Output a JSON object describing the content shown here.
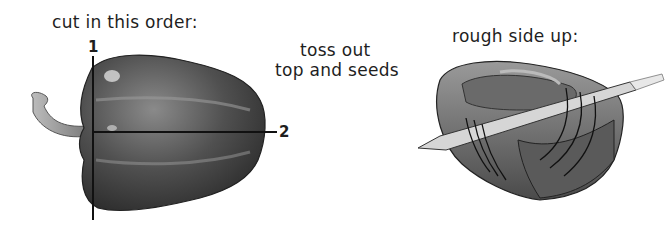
{
  "step1": {
    "caption": "cut in this order:",
    "cut_labels": [
      "1",
      "2"
    ]
  },
  "step2": {
    "caption_line1": "toss out",
    "caption_line2": "top and seeds"
  },
  "step3": {
    "caption": "rough side up:"
  },
  "colors": {
    "pepper_dark": "#3a3a3a",
    "pepper_mid": "#6a6a6a",
    "highlight": "#d8d8d8",
    "line": "#111111"
  }
}
